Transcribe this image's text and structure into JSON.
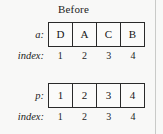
{
  "figure": {
    "title": "Before",
    "margin_rule_color": "#c9cac8",
    "background_color": "#f8f8f7",
    "border_color": "#2a2a2a"
  },
  "rows": [
    {
      "label": "a:",
      "cells": [
        "D",
        "A",
        "C",
        "B"
      ],
      "index_label": "index:",
      "indices": [
        "1",
        "2",
        "3",
        "4"
      ]
    },
    {
      "label": "p:",
      "cells": [
        "1",
        "2",
        "3",
        "4"
      ],
      "index_label": "index:",
      "indices": [
        "1",
        "2",
        "3",
        "4"
      ]
    }
  ]
}
